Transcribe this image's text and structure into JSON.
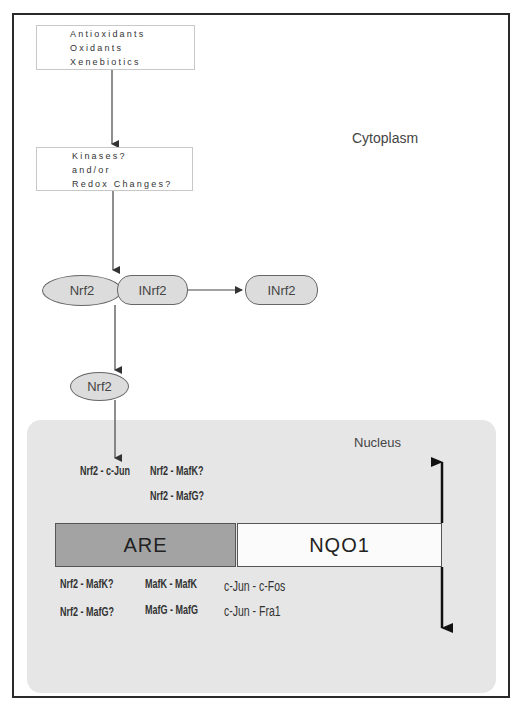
{
  "diagram": {
    "regions": {
      "cytoplasm": "Cytoplasm",
      "nucleus": "Nucleus"
    },
    "stimulus_box": {
      "lines": [
        "Antioxidants",
        "Oxidants",
        "Xenebiotics"
      ]
    },
    "signal_box": {
      "lines": [
        "Kinases?",
        "and/or",
        "Redox Changes?"
      ]
    },
    "complex_nodes": {
      "nrf2": "Nrf2",
      "inrf2": "INrf2",
      "released_inrf2": "INrf2",
      "free_nrf2": "Nrf2"
    },
    "nuclear_complexes_top": {
      "row1": [
        "Nrf2 - c-Jun",
        "Nrf2 - MafK?"
      ],
      "row2": [
        "Nrf2 - MafG?"
      ]
    },
    "promoter": {
      "element": "ARE",
      "gene": "NQO1"
    },
    "nuclear_complexes_bottom": {
      "row1": [
        "Nrf2 - MafK?",
        "MafK - MafK",
        "c-Jun - c-Fos"
      ],
      "row2": [
        "Nrf2 - MafG?",
        "MafG - MafG",
        "c-Jun - Fra1"
      ]
    },
    "arrows": [
      {
        "from": "stimulus_box",
        "to": "signal_box"
      },
      {
        "from": "signal_box",
        "to": "nrf2_inrf2_complex"
      },
      {
        "from": "inrf2",
        "to": "released_inrf2"
      },
      {
        "from": "nrf2_inrf2_complex",
        "to": "free_nrf2"
      },
      {
        "from": "free_nrf2",
        "to": "nuclear_complexes"
      },
      {
        "from": "NQO1",
        "to": "up",
        "style": "thick"
      },
      {
        "from": "NQO1",
        "to": "down",
        "style": "thick"
      }
    ],
    "colors": {
      "node_fill": "#dcdcdc",
      "nucleus_fill": "#e6e6e6",
      "are_fill": "#a3a3a3",
      "nqo1_fill": "#fbfbfb",
      "frame": "#2a2a2a"
    }
  }
}
